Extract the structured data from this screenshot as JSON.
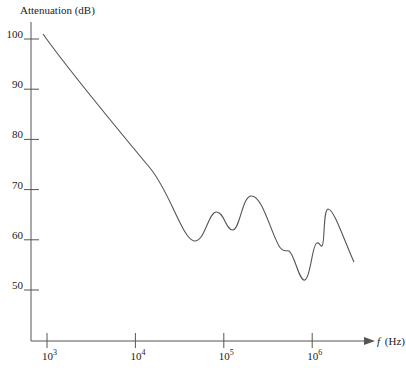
{
  "chart_data": {
    "type": "line",
    "title": "",
    "ylabel": "Attenuation (dB)",
    "xlabel_italic": "f",
    "xlabel_unit": "(Hz)",
    "xscale": "log",
    "xlim": [
      700,
      3000000
    ],
    "ylim": [
      43,
      103
    ],
    "grid": false,
    "legend": null,
    "y_ticks": [
      100,
      90,
      80,
      70,
      60,
      50
    ],
    "x_ticks": [
      {
        "value": 1000,
        "base": "10",
        "exp": "3"
      },
      {
        "value": 10000,
        "base": "10",
        "exp": "4"
      },
      {
        "value": 100000,
        "base": "10",
        "exp": "5"
      },
      {
        "value": 1000000,
        "base": "10",
        "exp": "6"
      }
    ],
    "series": [
      {
        "name": "Attenuation",
        "x": [
          900,
          2000,
          5000,
          10000,
          20000,
          40000,
          60000,
          85000,
          120000,
          160000,
          210000,
          300000,
          450000,
          550000,
          650000,
          800000,
          950000,
          1100000,
          1250000,
          1450000,
          2000000,
          2800000
        ],
        "y": [
          101,
          92.5,
          83,
          76,
          68,
          60,
          61,
          65.5,
          62,
          66,
          68.8,
          63.5,
          57.8,
          57.5,
          54,
          52,
          58.5,
          59,
          62,
          66,
          62,
          56
        ]
      }
    ]
  }
}
